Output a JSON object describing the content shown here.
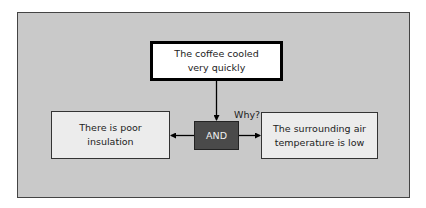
{
  "diagram": {
    "type": "causal-why-tree",
    "top_node": {
      "text": "The coffee cooled very quickly"
    },
    "question_label": "Why?",
    "gate": {
      "text": "AND"
    },
    "causes": [
      {
        "text": "There is poor insulation"
      },
      {
        "text": "The surrounding air temperature is low"
      }
    ],
    "colors": {
      "panel": "#c9c9c9",
      "top_node_fill": "#ffffff",
      "cause_fill": "#ececec",
      "gate_fill": "#4a4a4a",
      "gate_text": "#f0f0f0",
      "stroke": "#000000"
    }
  }
}
